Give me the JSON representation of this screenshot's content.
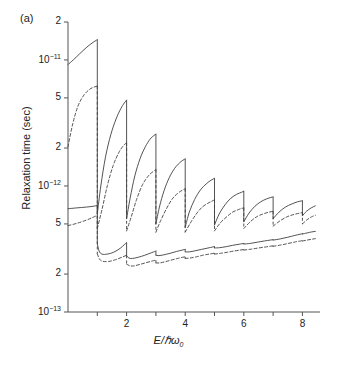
{
  "panel": {
    "label": "(a)"
  },
  "chart_data": {
    "type": "line",
    "title": "",
    "xlabel": "E/ℏω₀",
    "ylabel": "Relaxation time (sec)",
    "yscale": "log",
    "ylim": [
      1e-13,
      2e-11
    ],
    "xlim": [
      0,
      8.6
    ],
    "grid": false,
    "legend": "none",
    "x_ticks": [
      1,
      2,
      3,
      4,
      5,
      6,
      7,
      8
    ],
    "x_tick_labels": [
      "",
      "2",
      "",
      "4",
      "",
      "6",
      "",
      "8"
    ],
    "y_ticks": [
      2e-11,
      1e-11,
      5e-12,
      2e-12,
      1e-12,
      5e-13,
      2e-13,
      1e-13
    ],
    "y_tick_labels": [
      "2",
      "10⁻¹¹",
      "5",
      "2",
      "10⁻¹²",
      "5",
      "2",
      "10⁻¹³"
    ],
    "series": [
      {
        "name": "upper-solid",
        "style": "solid",
        "color": "#404040",
        "description": "Upper branch, solid: sawtooth with discontinuous drops at each integer E/hw0",
        "segments": [
          {
            "x": [
              0.0,
              0.18,
              0.4,
              0.62,
              0.82,
              1.0
            ],
            "y": [
              9.2e-12,
              1e-11,
              1.12e-11,
              1.25e-11,
              1.36e-11,
              1.45e-11
            ]
          },
          {
            "x": [
              1.0,
              1.12,
              1.28,
              1.46,
              1.64,
              1.8,
              1.92,
              2.0
            ],
            "y": [
              6e-13,
              1e-12,
              1.7e-12,
              2.55e-12,
              3.4e-12,
              4.1e-12,
              4.55e-12,
              4.8e-12
            ]
          },
          {
            "x": [
              2.0,
              2.12,
              2.28,
              2.46,
              2.64,
              2.8,
              2.92,
              3.0
            ],
            "y": [
              5.5e-13,
              8e-13,
              1.2e-12,
              1.65e-12,
              2.05e-12,
              2.35e-12,
              2.5e-12,
              2.58e-12
            ]
          },
          {
            "x": [
              3.0,
              3.12,
              3.28,
              3.46,
              3.64,
              3.8,
              3.92,
              4.0
            ],
            "y": [
              5e-13,
              6.8e-13,
              9.2e-13,
              1.17e-12,
              1.38e-12,
              1.52e-12,
              1.6e-12,
              1.64e-12
            ]
          },
          {
            "x": [
              4.0,
              4.14,
              4.32,
              4.52,
              4.72,
              4.88,
              5.0
            ],
            "y": [
              4.7e-13,
              6.2e-13,
              7.8e-13,
              9.3e-13,
              1.04e-12,
              1.11e-12,
              1.15e-12
            ]
          },
          {
            "x": [
              5.0,
              5.16,
              5.36,
              5.56,
              5.76,
              5.92,
              6.0
            ],
            "y": [
              4.9e-13,
              6e-13,
              7.1e-13,
              8e-13,
              8.6e-13,
              8.9e-13,
              9.1e-13
            ]
          },
          {
            "x": [
              6.0,
              6.18,
              6.38,
              6.58,
              6.78,
              6.92,
              7.0
            ],
            "y": [
              5.2e-13,
              6.1e-13,
              6.9e-13,
              7.5e-13,
              7.9e-13,
              8.1e-13,
              8.2e-13
            ]
          },
          {
            "x": [
              7.0,
              7.2,
              7.42,
              7.64,
              7.84,
              7.96,
              8.0
            ],
            "y": [
              5.5e-13,
              6.2e-13,
              6.8e-13,
              7.2e-13,
              7.5e-13,
              7.6e-13,
              7.65e-13
            ]
          },
          {
            "x": [
              8.0,
              8.14,
              8.3,
              8.44
            ],
            "y": [
              5.8e-13,
              6.3e-13,
              6.7e-13,
              6.95e-13
            ]
          }
        ]
      },
      {
        "name": "upper-dashed",
        "style": "dashed",
        "color": "#404040",
        "description": "Upper branch, dashed: companion curve lying below the upper solid curve",
        "segments": [
          {
            "x": [
              0.0,
              0.16,
              0.34,
              0.54,
              0.74,
              0.9,
              1.0
            ],
            "y": [
              2.05e-12,
              3.1e-12,
              4.3e-12,
              5.25e-12,
              5.85e-12,
              6.1e-12,
              6.2e-12
            ]
          },
          {
            "x": [
              1.0,
              1.16,
              1.34,
              1.54,
              1.74,
              1.9,
              2.0
            ],
            "y": [
              4.6e-13,
              6.5e-13,
              1e-12,
              1.45e-12,
              1.85e-12,
              2.1e-12,
              2.2e-12
            ]
          },
          {
            "x": [
              2.0,
              2.16,
              2.34,
              2.54,
              2.74,
              2.9,
              3.0
            ],
            "y": [
              4.4e-13,
              5.7e-13,
              7.8e-13,
              1.02e-12,
              1.2e-12,
              1.3e-12,
              1.35e-12
            ]
          },
          {
            "x": [
              3.0,
              3.16,
              3.36,
              3.56,
              3.76,
              3.92,
              4.0
            ],
            "y": [
              4.3e-13,
              5.3e-13,
              6.6e-13,
              7.9e-13,
              8.8e-13,
              9.3e-13,
              9.5e-13
            ]
          },
          {
            "x": [
              4.0,
              4.18,
              4.38,
              4.58,
              4.78,
              4.92,
              5.0
            ],
            "y": [
              4.3e-13,
              5.1e-13,
              6e-13,
              6.8e-13,
              7.3e-13,
              7.6e-13,
              7.75e-13
            ]
          },
          {
            "x": [
              5.0,
              5.2,
              5.42,
              5.62,
              5.82,
              5.94,
              6.0
            ],
            "y": [
              4.4e-13,
              5.1e-13,
              5.7e-13,
              6.2e-13,
              6.5e-13,
              6.65e-13,
              6.7e-13
            ]
          },
          {
            "x": [
              6.0,
              6.22,
              6.44,
              6.66,
              6.86,
              7.0
            ],
            "y": [
              4.6e-13,
              5.2e-13,
              5.7e-13,
              6e-13,
              6.2e-13,
              6.3e-13
            ]
          },
          {
            "x": [
              7.0,
              7.24,
              7.48,
              7.72,
              7.92,
              8.0
            ],
            "y": [
              4.8e-13,
              5.3e-13,
              5.7e-13,
              5.95e-13,
              6.1e-13,
              6.15e-13
            ]
          },
          {
            "x": [
              8.0,
              8.16,
              8.32,
              8.44
            ],
            "y": [
              5e-13,
              5.4e-13,
              5.7e-13,
              5.85e-13
            ]
          }
        ]
      },
      {
        "name": "lower-solid",
        "style": "solid",
        "color": "#404040",
        "description": "Lower branch, solid: slowly rising scalloped curve near 3e-13",
        "segments": [
          {
            "x": [
              0.0,
              0.3,
              0.62,
              0.86,
              1.0
            ],
            "y": [
              6.6e-13,
              6.7e-13,
              6.8e-13,
              6.9e-13,
              7e-13
            ]
          },
          {
            "x": [
              1.0,
              1.06,
              1.16,
              1.34,
              1.56,
              1.78,
              1.92,
              2.0
            ],
            "y": [
              3.5e-13,
              3.05e-13,
              2.88e-13,
              2.88e-13,
              2.98e-13,
              3.2e-13,
              3.42e-13,
              3.55e-13
            ]
          },
          {
            "x": [
              2.0,
              2.08,
              2.2,
              2.4,
              2.62,
              2.84,
              2.96,
              3.0
            ],
            "y": [
              2.8e-13,
              2.68e-13,
              2.66e-13,
              2.72e-13,
              2.82e-13,
              2.95e-13,
              3.02e-13,
              3.05e-13
            ]
          },
          {
            "x": [
              3.0,
              3.1,
              3.26,
              3.48,
              3.7,
              3.9,
              4.0
            ],
            "y": [
              2.82e-13,
              2.8e-13,
              2.84e-13,
              2.92e-13,
              3.02e-13,
              3.1e-13,
              3.14e-13
            ]
          },
          {
            "x": [
              4.0,
              4.14,
              4.34,
              4.56,
              4.78,
              4.94,
              5.0
            ],
            "y": [
              3e-13,
              3e-13,
              3.06e-13,
              3.14e-13,
              3.22e-13,
              3.28e-13,
              3.3e-13
            ]
          },
          {
            "x": [
              5.0,
              5.18,
              5.4,
              5.62,
              5.84,
              6.0
            ],
            "y": [
              3.22e-13,
              3.24e-13,
              3.3e-13,
              3.38e-13,
              3.45e-13,
              3.5e-13
            ]
          },
          {
            "x": [
              6.0,
              6.22,
              6.46,
              6.7,
              6.9,
              7.0
            ],
            "y": [
              3.46e-13,
              3.5e-13,
              3.58e-13,
              3.66e-13,
              3.72e-13,
              3.75e-13
            ]
          },
          {
            "x": [
              7.0,
              7.24,
              7.5,
              7.74,
              7.92,
              8.0
            ],
            "y": [
              3.72e-13,
              3.8e-13,
              3.92e-13,
              4.05e-13,
              4.14e-13,
              4.18e-13
            ]
          },
          {
            "x": [
              8.0,
              8.16,
              8.32,
              8.44
            ],
            "y": [
              4.16e-13,
              4.24e-13,
              4.32e-13,
              4.36e-13
            ]
          }
        ]
      },
      {
        "name": "lower-dashed",
        "style": "dashed",
        "color": "#404040",
        "description": "Lower branch, dashed: companion curve just below the lower solid curve",
        "segments": [
          {
            "x": [
              0.0,
              0.3,
              0.62,
              0.86,
              1.0
            ],
            "y": [
              4.85e-13,
              5.05e-13,
              5.35e-13,
              5.65e-13,
              5.85e-13
            ]
          },
          {
            "x": [
              1.0,
              1.08,
              1.2,
              1.4,
              1.62,
              1.84,
              2.0
            ],
            "y": [
              2.9e-13,
              2.62e-13,
              2.52e-13,
              2.52e-13,
              2.6e-13,
              2.72e-13,
              2.82e-13
            ]
          },
          {
            "x": [
              2.0,
              2.1,
              2.24,
              2.44,
              2.66,
              2.88,
              3.0
            ],
            "y": [
              2.4e-13,
              2.33e-13,
              2.32e-13,
              2.38e-13,
              2.46e-13,
              2.54e-13,
              2.58e-13
            ]
          },
          {
            "x": [
              3.0,
              3.12,
              3.3,
              3.52,
              3.74,
              3.92,
              4.0
            ],
            "y": [
              2.45e-13,
              2.45e-13,
              2.5e-13,
              2.58e-13,
              2.66e-13,
              2.72e-13,
              2.74e-13
            ]
          },
          {
            "x": [
              4.0,
              4.16,
              4.38,
              4.6,
              4.82,
              5.0
            ],
            "y": [
              2.66e-13,
              2.68e-13,
              2.74e-13,
              2.82e-13,
              2.88e-13,
              2.93e-13
            ]
          },
          {
            "x": [
              5.0,
              5.2,
              5.44,
              5.68,
              5.88,
              6.0
            ],
            "y": [
              2.88e-13,
              2.92e-13,
              2.98e-13,
              3.05e-13,
              3.1e-13,
              3.13e-13
            ]
          },
          {
            "x": [
              6.0,
              6.24,
              6.5,
              6.74,
              6.92,
              7.0
            ],
            "y": [
              3.1e-13,
              3.15e-13,
              3.22e-13,
              3.28e-13,
              3.33e-13,
              3.35e-13
            ]
          },
          {
            "x": [
              7.0,
              7.26,
              7.52,
              7.76,
              7.94,
              8.0
            ],
            "y": [
              3.32e-13,
              3.4e-13,
              3.5e-13,
              3.6e-13,
              3.66e-13,
              3.68e-13
            ]
          },
          {
            "x": [
              8.0,
              8.16,
              8.32,
              8.44
            ],
            "y": [
              3.66e-13,
              3.72e-13,
              3.78e-13,
              3.82e-13
            ]
          }
        ]
      }
    ]
  }
}
